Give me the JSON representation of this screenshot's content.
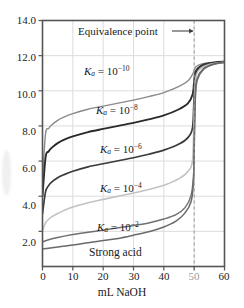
{
  "chart_data": {
    "type": "line",
    "title": "",
    "xlabel": "mL NaOH",
    "ylabel": "",
    "xlim": [
      0,
      60
    ],
    "ylim": [
      0,
      14
    ],
    "grid": true,
    "legend_position": "inline-curve-labels",
    "xticks": [
      0,
      10,
      20,
      30,
      40,
      50,
      60
    ],
    "xtick_labels": [
      "0",
      "10",
      "20",
      "30",
      "40",
      "50",
      "60"
    ],
    "yticks": [
      2.0,
      4.0,
      6.0,
      8.0,
      10.0,
      12.0,
      14.0
    ],
    "ytick_labels": [
      "2.0",
      "4.0",
      "6.0",
      "8.0",
      "10.0",
      "12.0",
      "14.0"
    ],
    "annotations": [
      {
        "text": "Equivalence point",
        "x": 25,
        "y": 13.0,
        "arrow_to_x": 50,
        "type": "arrow-right"
      },
      {
        "text": "equivalence-line",
        "x": 50,
        "type": "vertical-dashed"
      }
    ],
    "series": [
      {
        "name": "Ka = 10^-10",
        "label": "K_a = 10^{-10}",
        "ka": "1e-10",
        "color": "#8a8a8a",
        "width": 1.4,
        "x": [
          0,
          1,
          2,
          3,
          5,
          7,
          10,
          15,
          20,
          25,
          30,
          35,
          40,
          45,
          48,
          49.5,
          50,
          50.5,
          52,
          55,
          60
        ],
        "y": [
          5.0,
          7.55,
          7.85,
          8.05,
          8.32,
          8.5,
          8.7,
          8.95,
          9.13,
          9.3,
          9.47,
          9.67,
          9.9,
          10.25,
          10.57,
          10.95,
          11.15,
          11.35,
          11.5,
          11.6,
          11.68
        ]
      },
      {
        "name": "Ka = 10^-8",
        "label": "K_a = 10^{-8}",
        "ka": "1e-8",
        "color": "#2a2a2a",
        "width": 1.9,
        "x": [
          0,
          1,
          2,
          3,
          5,
          7,
          10,
          15,
          20,
          25,
          30,
          35,
          40,
          45,
          48,
          49.5,
          50,
          50.5,
          52,
          55,
          60
        ],
        "y": [
          4.0,
          6.2,
          6.55,
          6.75,
          7.02,
          7.2,
          7.4,
          7.65,
          7.83,
          8.0,
          8.17,
          8.37,
          8.6,
          8.95,
          9.3,
          9.8,
          10.55,
          11.1,
          11.4,
          11.57,
          11.66
        ]
      },
      {
        "name": "Ka = 10^-6",
        "label": "K_a = 10^{-6}",
        "ka": "1e-6",
        "color": "#3a3a3a",
        "width": 1.7,
        "x": [
          0,
          1,
          2,
          3,
          5,
          7,
          10,
          15,
          20,
          25,
          30,
          35,
          40,
          45,
          48,
          49.5,
          50,
          50.5,
          52,
          55,
          60
        ],
        "y": [
          3.0,
          4.25,
          4.6,
          4.8,
          5.05,
          5.22,
          5.42,
          5.67,
          5.85,
          6.02,
          6.19,
          6.39,
          6.62,
          6.97,
          7.35,
          7.95,
          9.85,
          10.95,
          11.35,
          11.55,
          11.65
        ]
      },
      {
        "name": "Ka = 10^-4",
        "label": "K_a = 10^{-4}",
        "ka": "1e-4",
        "color": "#c2c2c2",
        "width": 1.6,
        "x": [
          0,
          1,
          2,
          3,
          5,
          7,
          10,
          15,
          20,
          25,
          30,
          35,
          40,
          45,
          48,
          49.5,
          50,
          50.5,
          52,
          55,
          60
        ],
        "y": [
          2.05,
          2.48,
          2.68,
          2.82,
          3.02,
          3.18,
          3.38,
          3.63,
          3.82,
          4.0,
          4.18,
          4.38,
          4.62,
          5.0,
          5.42,
          6.1,
          8.8,
          10.7,
          11.25,
          11.5,
          11.63
        ]
      },
      {
        "name": "Ka = 10^-2",
        "label": "K_a = 10^{-2}",
        "ka": "1e-2",
        "color": "#707070",
        "width": 1.5,
        "x": [
          0,
          2,
          5,
          10,
          15,
          20,
          25,
          30,
          35,
          40,
          44,
          47,
          49,
          49.8,
          50,
          50.4,
          51,
          53,
          56,
          60
        ],
        "y": [
          1.4,
          1.52,
          1.65,
          1.82,
          1.95,
          2.07,
          2.2,
          2.33,
          2.48,
          2.7,
          2.95,
          3.35,
          4.05,
          5.2,
          6.5,
          9.6,
          10.6,
          11.2,
          11.48,
          11.62
        ]
      },
      {
        "name": "Strong acid",
        "label": "Strong acid",
        "ka": "strong",
        "color": "#6a6a6a",
        "width": 1.5,
        "x": [
          0,
          2,
          5,
          10,
          15,
          20,
          25,
          30,
          35,
          40,
          44,
          47,
          49,
          49.8,
          50,
          50.4,
          51,
          53,
          56,
          60
        ],
        "y": [
          1.0,
          1.04,
          1.11,
          1.22,
          1.35,
          1.48,
          1.6,
          1.78,
          1.98,
          2.25,
          2.58,
          3.05,
          3.7,
          4.9,
          7.0,
          9.9,
          10.7,
          11.25,
          11.5,
          11.63
        ]
      }
    ]
  },
  "axes": {
    "xlabel": "mL NaOH",
    "xticks": [
      "0",
      "10",
      "20",
      "30",
      "40",
      "50",
      "60"
    ],
    "yticks": [
      "14.0",
      "12.0",
      "10.0",
      "8.0",
      "6.0",
      "4.0",
      "2.0"
    ]
  },
  "labels": {
    "equivalence": "Equivalence point",
    "ka10": "K",
    "ka_sub": "a",
    "eq": " = 10",
    "exp10": "−10",
    "exp8": "−8",
    "exp6": "−6",
    "exp4": "−4",
    "exp2": "−2",
    "strong_acid": "Strong acid"
  },
  "colors": {
    "frame": "#555555",
    "grid": "#dcdcdc",
    "dashed": "#9a9a9a",
    "text": "#1a1a1a"
  }
}
